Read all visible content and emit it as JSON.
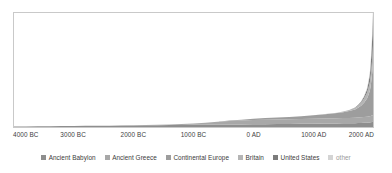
{
  "chart_data": {
    "type": "area",
    "title": "",
    "subtitle": "",
    "xlabel": "",
    "ylabel": "",
    "stacked": true,
    "grid": false,
    "legend_position": "bottom",
    "xlim": [
      -4000,
      2000
    ],
    "ylim": [
      0,
      100
    ],
    "x_tick_labels": [
      "4000 BC",
      "3000 BC",
      "2000 BC",
      "1000 BC",
      "0 AD",
      "1000 AD",
      "2000 AD"
    ],
    "x_tick_values": [
      -4000,
      -3000,
      -2000,
      -1000,
      0,
      1000,
      2000
    ],
    "y_tick_labels": [],
    "x": [
      -4000,
      -3800,
      -3600,
      -3400,
      -3200,
      -3000,
      -2800,
      -2600,
      -2400,
      -2200,
      -2000,
      -1800,
      -1600,
      -1400,
      -1200,
      -1000,
      -800,
      -600,
      -400,
      -200,
      0,
      200,
      400,
      600,
      800,
      1000,
      1200,
      1400,
      1500,
      1600,
      1700,
      1750,
      1800,
      1850,
      1900,
      1925,
      1950,
      1960,
      1970,
      1980,
      1990,
      2000
    ],
    "series": [
      {
        "name": "Ancient Babylon",
        "color": "#8e8e8e",
        "values": [
          0.4,
          0.5,
          0.6,
          0.7,
          0.8,
          0.9,
          1.0,
          1.1,
          1.2,
          1.3,
          1.4,
          1.5,
          1.6,
          1.7,
          1.8,
          1.9,
          2.0,
          2.1,
          2.2,
          2.3,
          2.4,
          2.5,
          2.6,
          2.7,
          2.8,
          2.9,
          3.0,
          3.1,
          3.2,
          3.3,
          3.4,
          3.5,
          3.6,
          3.7,
          3.8,
          3.9,
          4.0,
          4.1,
          4.2,
          4.3,
          4.4,
          4.5
        ]
      },
      {
        "name": "Ancient Greece",
        "color": "#a8a8a8",
        "values": [
          0,
          0,
          0,
          0,
          0,
          0,
          0,
          0,
          0,
          0,
          0.1,
          0.2,
          0.3,
          0.5,
          0.8,
          1.2,
          1.8,
          2.4,
          3.0,
          3.4,
          3.7,
          3.9,
          4.0,
          4.1,
          4.2,
          4.3,
          4.4,
          4.5,
          4.6,
          4.7,
          4.8,
          4.9,
          5.0,
          5.1,
          5.2,
          5.3,
          5.4,
          5.5,
          5.6,
          5.7,
          5.8,
          5.9
        ]
      },
      {
        "name": "Continental Europe",
        "color": "#9d9d9d",
        "values": [
          0,
          0,
          0,
          0,
          0,
          0,
          0,
          0,
          0,
          0,
          0,
          0,
          0,
          0,
          0,
          0,
          0,
          0.2,
          0.4,
          0.7,
          1.1,
          1.4,
          1.7,
          2.0,
          2.4,
          3.0,
          3.8,
          4.6,
          5.2,
          6.0,
          7.2,
          8.4,
          10.0,
          12.5,
          16.0,
          19.0,
          23.0,
          26.0,
          30.0,
          34.0,
          39.0,
          46.0
        ]
      },
      {
        "name": "Britain",
        "color": "#b5b5b5",
        "values": [
          0,
          0,
          0,
          0,
          0,
          0,
          0,
          0,
          0,
          0,
          0,
          0,
          0,
          0,
          0,
          0,
          0,
          0,
          0,
          0,
          0,
          0,
          0,
          0,
          0,
          0.1,
          0.2,
          0.4,
          0.6,
          0.9,
          1.4,
          1.9,
          2.6,
          3.6,
          5.0,
          6.2,
          7.6,
          8.6,
          9.8,
          11.2,
          13.0,
          15.5
        ]
      },
      {
        "name": "United States",
        "color": "#7c7c7c",
        "values": [
          0,
          0,
          0,
          0,
          0,
          0,
          0,
          0,
          0,
          0,
          0,
          0,
          0,
          0,
          0,
          0,
          0,
          0,
          0,
          0,
          0,
          0,
          0,
          0,
          0,
          0,
          0,
          0,
          0,
          0.1,
          0.3,
          0.5,
          0.9,
          1.6,
          3.0,
          4.6,
          7.0,
          9.0,
          12.0,
          15.5,
          20.0,
          26.0
        ]
      },
      {
        "name": "other",
        "color": "#d4d4d4",
        "values": [
          0,
          0,
          0,
          0,
          0,
          0,
          0,
          0,
          0,
          0,
          0,
          0,
          0,
          0,
          0,
          0,
          0,
          0,
          0,
          0,
          0,
          0,
          0,
          0,
          0,
          0,
          0,
          0,
          0,
          0,
          0.1,
          0.2,
          0.4,
          0.7,
          1.2,
          1.8,
          2.6,
          3.2,
          4.0,
          5.0,
          6.2,
          8.0
        ]
      }
    ]
  },
  "legend": {
    "items": [
      {
        "label": "Ancient Babylon",
        "color": "#8e8e8e"
      },
      {
        "label": "Ancient Greece",
        "color": "#a8a8a8"
      },
      {
        "label": "Continental Europe",
        "color": "#9d9d9d"
      },
      {
        "label": "Britain",
        "color": "#b5b5b5"
      },
      {
        "label": "United States",
        "color": "#7c7c7c"
      },
      {
        "label": "other",
        "color": "#d4d4d4"
      }
    ]
  },
  "axis": {
    "ticks": [
      {
        "label": "4000 BC",
        "value": -4000
      },
      {
        "label": "3000 BC",
        "value": -3000
      },
      {
        "label": "2000 BC",
        "value": -2000
      },
      {
        "label": "1000 BC",
        "value": -1000
      },
      {
        "label": "0 AD",
        "value": 0
      },
      {
        "label": "1000 AD",
        "value": 1000
      },
      {
        "label": "2000 AD",
        "value": 2000
      }
    ]
  },
  "colors": {
    "plot_border": "#c9c9c9",
    "background": "#ffffff",
    "tick_text": "#3d3d3d"
  }
}
